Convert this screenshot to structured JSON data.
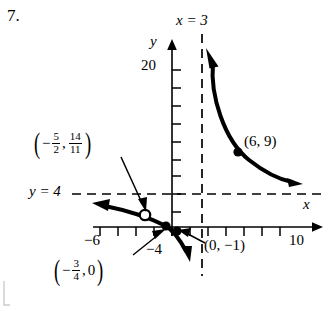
{
  "problem": {
    "number": "7."
  },
  "graph": {
    "axes": {
      "x_axis_label": "x",
      "y_axis_label": "y",
      "x_tick_labels": [
        "−6",
        "−4",
        "10"
      ],
      "y_tick_labels": [
        "20"
      ],
      "x_tick_spacing_units": 2,
      "y_tick_spacing_units": 2
    },
    "asymptotes": [
      {
        "name": "vertical-asymptote",
        "label": "x = 3",
        "type": "vertical",
        "value": 3,
        "style": "dashed"
      },
      {
        "name": "horizontal-asymptote",
        "label": "y = 4",
        "type": "horizontal",
        "value": 4,
        "style": "dashed"
      }
    ],
    "points": [
      {
        "name": "point-6-9",
        "label": "(6, 9)",
        "x": 6,
        "y": 9,
        "marker": "filled"
      },
      {
        "name": "point-0-neg1",
        "label": "(0, −1)",
        "x": 0,
        "y": -1,
        "marker": "filled"
      },
      {
        "name": "point-neg-three-quarters-zero",
        "label_parts": {
          "open": "(",
          "sign": "−",
          "num1": "3",
          "den1": "4",
          "comma": ",",
          "second": "0",
          "close": ")"
        },
        "x": -0.75,
        "y": 0,
        "marker": "filled"
      },
      {
        "name": "point-hole-neg-five-halves",
        "label_parts": {
          "open": "(",
          "sign": "−",
          "num1": "5",
          "den1": "2",
          "comma": ",",
          "num2": "14",
          "den2": "11",
          "close": ")"
        },
        "x": -2.5,
        "y": 1.2727,
        "marker": "open-circle"
      }
    ],
    "curve": {
      "type": "rational-function-hyperbola",
      "branches": [
        {
          "name": "left-branch",
          "description": "approaches y = 4 to the left, passes through hole and crosses near origin, arrows both ends"
        },
        {
          "name": "right-branch",
          "description": "descends from upper vertical asymptote x = 3 toward y = 4 on the right, arrows both ends"
        }
      ]
    },
    "colors": {
      "curve": "#000000",
      "axis": "#000000",
      "asymptote": "#000000",
      "background": "#ffffff"
    }
  }
}
